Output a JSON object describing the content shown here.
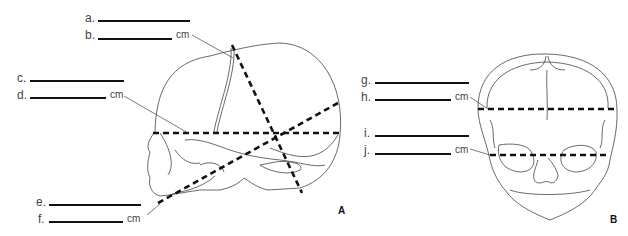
{
  "diagram": {
    "panels": [
      {
        "id": "A",
        "label": "A",
        "view": "lateral skull"
      },
      {
        "id": "B",
        "label": "B",
        "view": "frontal skull"
      }
    ],
    "blanks": [
      {
        "letter": "a.",
        "unit": ""
      },
      {
        "letter": "b.",
        "unit": "cm"
      },
      {
        "letter": "c.",
        "unit": ""
      },
      {
        "letter": "d.",
        "unit": "cm"
      },
      {
        "letter": "e.",
        "unit": ""
      },
      {
        "letter": "f.",
        "unit": "cm"
      },
      {
        "letter": "g.",
        "unit": ""
      },
      {
        "letter": "h.",
        "unit": "cm"
      },
      {
        "letter": "i.",
        "unit": ""
      },
      {
        "letter": "j.",
        "unit": "cm"
      }
    ],
    "colors": {
      "line": "#111111",
      "outline": "#444444"
    }
  }
}
